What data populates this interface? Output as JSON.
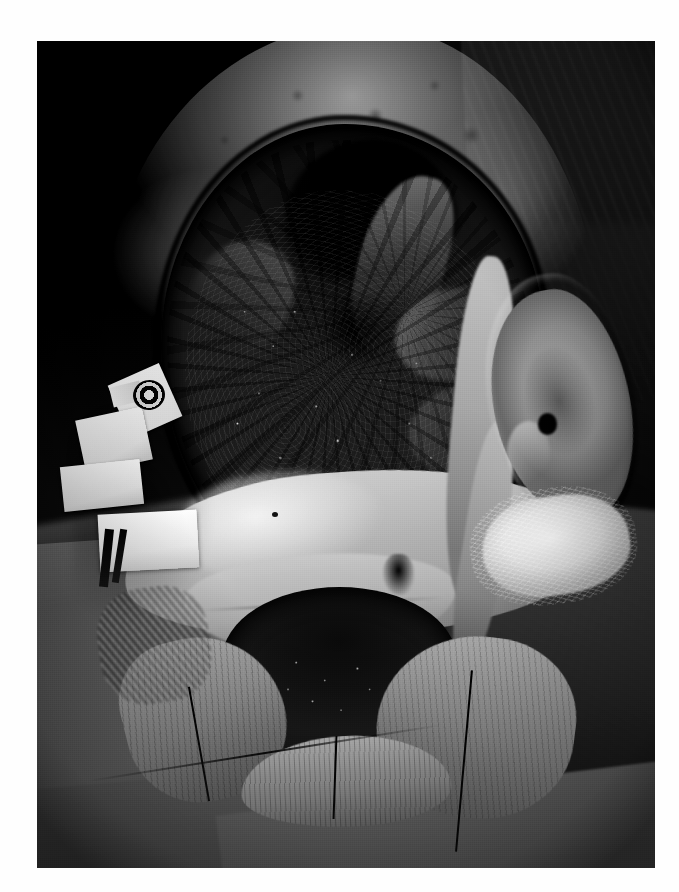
{
  "page": {
    "background_color": "#ffffff",
    "width": 679,
    "height": 892
  },
  "figure": {
    "name": "clinical-photograph",
    "type": "photograph",
    "color_mode": "grayscale",
    "frame": {
      "left": 37,
      "top": 41,
      "width": 618,
      "height": 827
    },
    "border_color": "#0a0a0a",
    "caption": "",
    "label": ""
  },
  "scene": {
    "subject": "head-and-neck-surgical-field",
    "background": "dark-operative-field",
    "regions": [
      {
        "id": "scalp-flap",
        "label": "elevated pale scalp flap rim",
        "tone": "light-gray"
      },
      {
        "id": "central-cavity",
        "label": "large dark exposed wound cavity",
        "tone": "dark"
      },
      {
        "id": "granulation",
        "label": "nodular granular tissue with specular highlights",
        "tone": "mixed"
      },
      {
        "id": "mid-flap-band",
        "label": "bright transverse tissue flap band",
        "tone": "bright"
      },
      {
        "id": "lower-neck-wound",
        "label": "lower neck wound with sutures",
        "tone": "dark"
      },
      {
        "id": "ear",
        "label": "right auricle",
        "tone": "light-gray"
      },
      {
        "id": "gauze-pad",
        "label": "white gauze dressing pad",
        "tone": "white"
      },
      {
        "id": "tape-strips",
        "label": "white adhesive tape strips",
        "tone": "white"
      },
      {
        "id": "tube-connector",
        "label": "dark ringed tube connector",
        "tone": "dark"
      },
      {
        "id": "drape-lower-left",
        "label": "surgical drape",
        "tone": "mid-gray"
      },
      {
        "id": "drape-right",
        "label": "surgical drape right side",
        "tone": "dark-gray"
      }
    ],
    "colors": {
      "photo_black": "#0a0a0a",
      "cavity_dark": "#1b1917",
      "tissue_mid": "#8f8a82",
      "tissue_light": "#c2bcb2",
      "highlight_white": "#f6f4f0",
      "drape_gray": "#6b6b6b",
      "page_white": "#ffffff"
    }
  }
}
